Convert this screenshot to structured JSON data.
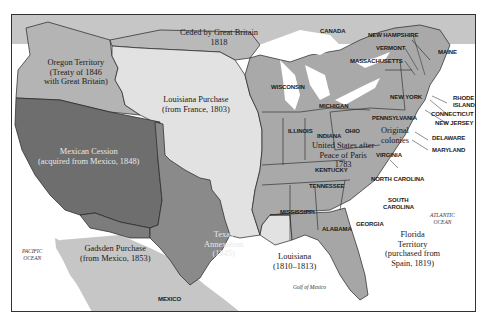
{
  "colors": {
    "background": "#ffffff",
    "original_us": "#a9a9a9",
    "louisiana_purchase": "#e2e2e2",
    "oregon": "#b4b4b4",
    "ceded_1818": "#b9b9b9",
    "mexican_cession": "#6e6e6e",
    "texas": "#8a8a8a",
    "gadsden": "#7c7c7c",
    "florida": "#a6a6a6",
    "foreign_land": "#c6c6c6",
    "water": "#ffffff",
    "border": "#222222"
  },
  "territories": [
    {
      "id": "oregon",
      "lines": [
        "Oregon Territory",
        "(Treaty of 1846",
        "with Great Britain)"
      ]
    },
    {
      "id": "ceded_1818",
      "lines": [
        "Ceded by Great Britain",
        "1818"
      ]
    },
    {
      "id": "louisiana_purchase",
      "lines": [
        "Louisiana Purchase",
        "(from France, 1803)"
      ]
    },
    {
      "id": "mexican_cession",
      "lines": [
        "Mexican Cession",
        "(acquired from Mexico, 1848)"
      ]
    },
    {
      "id": "texas",
      "lines": [
        "Texas",
        "Annexation",
        "(1845)"
      ]
    },
    {
      "id": "gadsden",
      "lines": [
        "Gadsden Purchase",
        "(from Mexico, 1853)"
      ]
    },
    {
      "id": "louisiana_1810",
      "lines": [
        "Louisiana",
        "(1810–1813)"
      ]
    },
    {
      "id": "florida",
      "lines": [
        "Florida",
        "Territory",
        "(purchased from",
        "Spain, 1819)"
      ]
    },
    {
      "id": "us_1783",
      "lines": [
        "United States after",
        "Peace of Paris",
        "1783"
      ]
    },
    {
      "id": "original_colonies",
      "lines": [
        "Original",
        "colonies"
      ]
    }
  ],
  "states": [
    "WISCONSIN",
    "MICHIGAN",
    "ILLINOIS",
    "INDIANA",
    "OHIO",
    "KENTUCKY",
    "TENNESSEE",
    "MISSISSIPPI",
    "ALABAMA",
    "GEORGIA",
    "SOUTH",
    "CAROLINA",
    "NORTH CAROLINA",
    "VIRGINIA",
    "PENNSYLVANIA",
    "NEW YORK",
    "NEW HAMPSHIRE",
    "VERMONT",
    "MASSACHUSETTS",
    "MAINE",
    "RHODE",
    "ISLAND",
    "CONNECTICUT",
    "NEW JERSEY",
    "DELAWARE",
    "MARYLAND"
  ],
  "countries": [
    "CANADA",
    "MEXICO"
  ],
  "oceans": [
    {
      "id": "pacific",
      "lines": [
        "PACIFIC",
        "OCEAN"
      ]
    },
    {
      "id": "atlantic",
      "lines": [
        "ATLANTIC",
        "OCEAN"
      ]
    },
    {
      "id": "gulf",
      "lines": [
        "Gulf of Mexico"
      ]
    }
  ]
}
